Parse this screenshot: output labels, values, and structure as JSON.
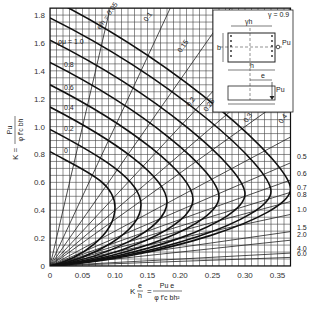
{
  "chart_data": {
    "type": "line",
    "xlabel": "K e/h = Pu e / (φ f'c b h²)",
    "ylabel": "K = Pu / (φ f'c b h)",
    "xlim": [
      0,
      0.37
    ],
    "ylim": [
      0,
      1.85
    ],
    "x_ticks": [
      "0",
      "0.05",
      "0.10",
      "0.15",
      "0.20",
      "0.25",
      "0.30",
      "0.35"
    ],
    "y_ticks": [
      "0",
      "0.2",
      "0.4",
      "0.6",
      "0.8",
      "1.0",
      "1.2",
      "1.4",
      "1.6",
      "1.8"
    ],
    "grid": true,
    "gamma": "γ = 0.9",
    "rho_label": "ρg μ",
    "curve_series_label_prefix": "ρμ =",
    "series": [
      {
        "name": "ρμ = 0",
        "peak_x": 0.1,
        "y_at_x0": 0.82
      },
      {
        "name": "ρμ = 0.2",
        "peak_x": 0.14,
        "y_at_x0": 0.98
      },
      {
        "name": "ρμ = 0.4",
        "peak_x": 0.18,
        "y_at_x0": 1.14
      },
      {
        "name": "ρμ = 0.6",
        "peak_x": 0.22,
        "y_at_x0": 1.3
      },
      {
        "name": "ρμ = 0.8",
        "peak_x": 0.26,
        "y_at_x0": 1.46
      },
      {
        "name": "ρμ = 1.0",
        "peak_x": 0.3,
        "y_at_x0": 1.62
      },
      {
        "name": "ρμ = 1.2",
        "peak_x": 0.34,
        "y_at_x0": 1.78
      },
      {
        "name": "ρμ = 1.4",
        "peak_x": 0.37,
        "y_at_x0": 1.92
      }
    ],
    "eh_lines": {
      "label": "e/h",
      "values": [
        0.05,
        0.1,
        0.15,
        0.2,
        0.25,
        0.3,
        0.4,
        0.5,
        0.6,
        0.7,
        0.8,
        1.0,
        1.5,
        2.0,
        4.0,
        6.0
      ],
      "top_labels": [
        "e/h = 0.05",
        "0.1",
        "0.15",
        "0.2",
        "0.25",
        "0.3",
        "0.4"
      ],
      "right_labels": [
        "0.5",
        "0.6",
        "0.7",
        "0.8",
        "1.0",
        "1.5",
        "2.0",
        "4.0",
        "6.0"
      ]
    },
    "left_curve_labels": [
      "ρμ = 1.0",
      "0.8",
      "0.6",
      "0.4",
      "0.2",
      "0"
    ],
    "inset": {
      "gamma_label": "γ = 0.9",
      "dims": [
        "γh",
        "b",
        "h",
        "e"
      ],
      "load": "Pu"
    }
  },
  "axes": {
    "x_label_left": "K",
    "x_label_frac_top": "e",
    "x_label_frac_bottom": "h",
    "x_label_eq": "=",
    "x_label_num": "Pu e",
    "x_label_den": "φ f'c bh²",
    "y_label_left": "K =",
    "y_label_num": "Pu",
    "y_label_den": "φ f'c bh"
  }
}
